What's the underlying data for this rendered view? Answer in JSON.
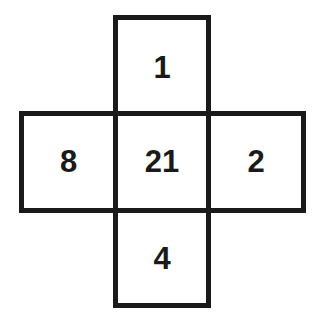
{
  "diagram": {
    "type": "cross-grid",
    "cells": {
      "top": {
        "value": "1"
      },
      "left": {
        "value": "8"
      },
      "center": {
        "value": "21"
      },
      "right": {
        "value": "2"
      },
      "bottom": {
        "value": "4"
      }
    },
    "colors": {
      "border": "#1a1a1a",
      "text": "#1a1a1a",
      "background": "#ffffff"
    }
  }
}
